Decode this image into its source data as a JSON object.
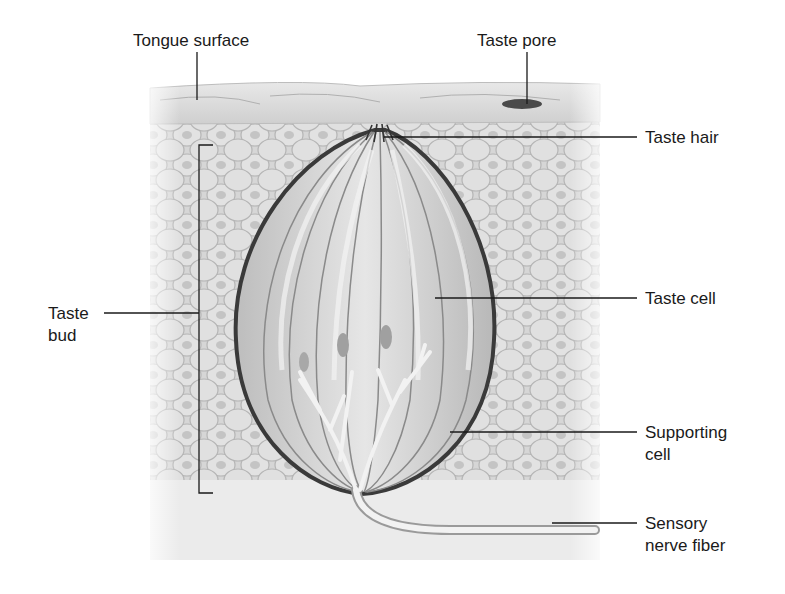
{
  "diagram": {
    "labels": {
      "tongue_surface": "Tongue surface",
      "taste_pore": "Taste pore",
      "taste_hair": "Taste hair",
      "taste_bud_line1": "Taste",
      "taste_bud_line2": "bud",
      "taste_cell": "Taste cell",
      "supporting_cell_line1": "Supporting",
      "supporting_cell_line2": "cell",
      "sensory_nerve_line1": "Sensory",
      "sensory_nerve_line2": "nerve fiber"
    },
    "colors": {
      "background": "#ffffff",
      "tissue": "#d9d9d9",
      "cell_outline": "#9a9a9a",
      "bud_outline": "#3a3a3a",
      "leader_line": "#1a1a1a",
      "text": "#1a1a1a"
    }
  }
}
